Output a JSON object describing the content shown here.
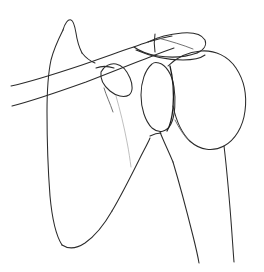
{
  "figure": {
    "style": "hand-drawn single-weight ink contour",
    "background_color": "#ffffff",
    "ink_color": "#2b2b2b",
    "faint_ink_color": "#b8b8b8",
    "width": 264,
    "height": 272,
    "caption": "",
    "labels": []
  },
  "structures": [
    {
      "id": "scapula-body",
      "name": "scapula body",
      "description": "large triangular blade occupying the left half, medial border descending to a rounded inferior angle"
    },
    {
      "id": "superior-angle",
      "name": "superior angle of scapula",
      "description": "pointed peak at upper left of the blade"
    },
    {
      "id": "clavicle",
      "name": "clavicle",
      "description": "two long gently curved parallel strokes running from lower left up to the right"
    },
    {
      "id": "acromion",
      "name": "acromion process",
      "description": "flat elongated horizontal plate at top right with an acromioclavicular separation line"
    },
    {
      "id": "coracoid",
      "name": "coracoid process",
      "description": "small rounded hook-shaped outline below the clavicle, left of the glenoid"
    },
    {
      "id": "glenoid",
      "name": "glenoid fossa",
      "description": "narrow vertical oval between the scapular neck and humeral head"
    },
    {
      "id": "humeral-head",
      "name": "head of humerus",
      "description": "large rounded dome at the right, articulating with the glenoid"
    },
    {
      "id": "humeral-shaft",
      "name": "shaft of humerus",
      "description": "two near-parallel strokes descending from the head to the lower right edge"
    },
    {
      "id": "scapular-neck",
      "name": "scapular neck and lateral border",
      "description": "faint stroke sweeping from below the coracoid down to the lateral border"
    }
  ],
  "paths": {
    "scapula_medial_border": "M 63,30 C 59,38 54,48 51,60 C 48,74 47,92 47,112 C 47,140 48,170 50,196 C 52,218 55,234 62,245",
    "scapula_superior_peak": "M 63,30 C 65,23 68,19 71,20 C 74,21 75,27 76,33 C 77,40 79,47 82,53",
    "scapula_superior_slope": "M 82,53 C 86,58 90,61 95,63",
    "scapula_inferior_angle": "M 62,245 C 68,249 76,249 85,243 C 95,236 104,225 112,211",
    "scapula_lateral_border": "M 112,211 C 121,196 130,178 139,160 C 144,150 148,143 150,138",
    "clavicle_upper": "M 11,86 C 30,82 55,74 82,65 C 108,56 130,48 148,42 C 158,39 166,37 172,36",
    "clavicle_lower": "M 12,106 C 32,101 58,92 86,82 C 112,72 134,63 150,57 C 160,53 168,50 174,48",
    "acromion_top": "M 148,42 C 158,37 170,34 182,33 C 194,32 202,35 205,40 C 207,45 204,50 197,53",
    "acromion_bottom": "M 197,53 C 186,57 171,58 158,56 C 146,54 138,50 134,47",
    "ac_joint_line": "M 155,34 C 154,40 154,46 155,52",
    "acromion_inner": "M 158,38 C 170,41 183,45 193,49",
    "acromion_under_edge": "M 136,50 C 150,56 168,60 183,60 C 194,60 201,58 205,55",
    "coracoid_outline": "M 101,72 C 104,66 110,63 116,64 C 122,65 127,71 130,78 C 133,85 133,92 129,95 C 124,98 116,96 110,91 C 104,86 100,79 101,72 Z",
    "coracoid_tail": "M 104,88 C 106,95 110,103 113,112",
    "coracoid_upper_tick": "M 96,68 C 101,66 108,66 114,68",
    "glenoid_outline": "M 152,64 C 145,70 141,82 141,95 C 141,108 145,121 152,128 C 159,134 167,132 171,124 C 175,116 176,100 174,87 C 172,74 166,65 159,63 C 156,62 154,62 152,64 Z",
    "glenoid_rim": "M 170,66 C 173,78 174,94 173,108 C 172,118 170,126 167,131",
    "humeral_head": "M 168,66 C 176,58 188,52 201,51 C 215,50 228,56 236,68 C 244,80 247,96 245,111 C 243,127 235,140 224,146 C 213,152 200,150 191,142 C 182,134 176,120 173,106",
    "humerus_neck_left": "M 160,132 C 163,140 168,150 173,162",
    "humerus_shaft_left": "M 173,162 C 179,182 186,208 193,236 C 196,248 198,257 199,263",
    "humerus_shaft_right": "M 224,146 C 226,162 228,184 230,208 C 232,232 233,250 234,262",
    "scapular_neck_faint": "M 116,96 C 120,110 124,126 127,142 C 129,152 130,160 131,167",
    "glenoid_junction": "M 150,136 C 154,134 158,133 161,133",
    "head_underline": "M 175,120 C 179,128 184,136 190,142"
  }
}
